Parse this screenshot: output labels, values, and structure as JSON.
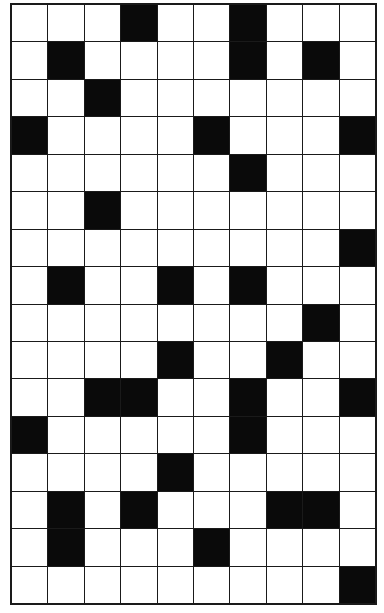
{
  "puzzle": {
    "type": "crossword-grid",
    "columns": 10,
    "rows": 16,
    "colors": {
      "white_cell": "#ffffff",
      "black_cell": "#0a0a0a",
      "grid_line": "#1a1a1a"
    },
    "black_cells": [
      [
        0,
        3
      ],
      [
        0,
        6
      ],
      [
        1,
        1
      ],
      [
        1,
        6
      ],
      [
        1,
        8
      ],
      [
        2,
        2
      ],
      [
        3,
        0
      ],
      [
        3,
        5
      ],
      [
        3,
        9
      ],
      [
        4,
        6
      ],
      [
        5,
        2
      ],
      [
        6,
        9
      ],
      [
        7,
        1
      ],
      [
        7,
        4
      ],
      [
        7,
        6
      ],
      [
        8,
        8
      ],
      [
        9,
        4
      ],
      [
        9,
        7
      ],
      [
        10,
        2
      ],
      [
        10,
        3
      ],
      [
        10,
        6
      ],
      [
        10,
        9
      ],
      [
        11,
        0
      ],
      [
        11,
        6
      ],
      [
        12,
        4
      ],
      [
        13,
        1
      ],
      [
        13,
        3
      ],
      [
        13,
        7
      ],
      [
        13,
        8
      ],
      [
        14,
        1
      ],
      [
        14,
        5
      ],
      [
        15,
        9
      ]
    ]
  }
}
